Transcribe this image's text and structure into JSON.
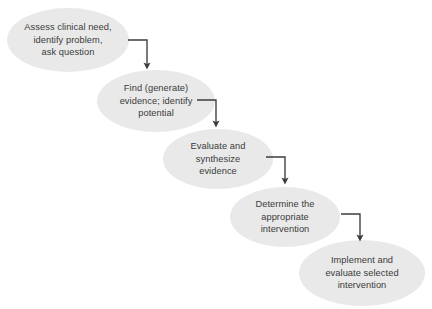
{
  "diagram": {
    "type": "flowchart",
    "background_color": "#ffffff",
    "node_fill_color": "#e9e9e9",
    "text_color": "#3b3b3b",
    "arrow_color": "#3c3c3c",
    "nodes": [
      {
        "id": "node-1",
        "label": "Assess clinical need,\nidentify problem,\nask question",
        "cx": 68,
        "cy": 40,
        "rx": 61,
        "ry": 32
      },
      {
        "id": "node-2",
        "label": "Find (generate)\nevidence; identify\npotential",
        "cx": 156,
        "cy": 101,
        "rx": 59,
        "ry": 31
      },
      {
        "id": "node-3",
        "label": "Evaluate and\nsynthesize\nevidence",
        "cx": 218,
        "cy": 159,
        "rx": 55,
        "ry": 30
      },
      {
        "id": "node-4",
        "label": "Determine the\nappropriate\nintervention",
        "cx": 285,
        "cy": 217,
        "rx": 55,
        "ry": 30
      },
      {
        "id": "node-5",
        "label": "Implement and\nevaluate selected\nintervention",
        "cx": 362,
        "cy": 273,
        "rx": 63,
        "ry": 33
      }
    ],
    "connectors": [
      {
        "id": "connector-1",
        "from": "node-1",
        "to": "node-2",
        "start_x": 128,
        "start_y": 40,
        "corner_x": 147,
        "end_y": 72
      },
      {
        "id": "connector-2",
        "from": "node-2",
        "to": "node-3",
        "start_x": 197,
        "start_y": 100,
        "corner_x": 216,
        "end_y": 130
      },
      {
        "id": "connector-3",
        "from": "node-3",
        "to": "node-4",
        "start_x": 266,
        "start_y": 157,
        "corner_x": 285,
        "end_y": 187
      },
      {
        "id": "connector-4",
        "from": "node-4",
        "to": "node-5",
        "start_x": 341,
        "start_y": 214,
        "corner_x": 360,
        "end_y": 244
      }
    ]
  }
}
